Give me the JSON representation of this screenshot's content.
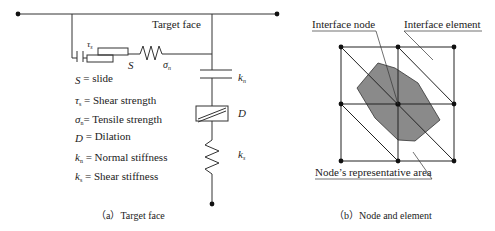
{
  "panel_a": {
    "label_target_face": "Target face",
    "symbols": {
      "tau": "τ",
      "tau_sub": "s",
      "S": "S",
      "sigma": "σ",
      "sigma_sub": "n",
      "kn": "k",
      "kn_sub": "n",
      "D": "D",
      "ks": "k",
      "ks_sub": "s"
    },
    "legend": [
      {
        "sym": "S",
        "sub": "",
        "text": " = slide"
      },
      {
        "sym": "τ",
        "sub": "s",
        "text": " = Shear strength"
      },
      {
        "sym": "σ",
        "sub": "n",
        "text": "= Tensile strength"
      },
      {
        "sym": "D",
        "sub": "",
        "text": " = Dilation"
      },
      {
        "sym": "k",
        "sub": "n",
        "text": " = Normal stiffness"
      },
      {
        "sym": "k",
        "sub": "s",
        "text": " = Shear stiffness"
      }
    ],
    "caption": "（a）Target face"
  },
  "panel_b": {
    "label_interface_node": "Interface node",
    "label_interface_element": "Interface element",
    "label_representative_area": "Node’s representative area",
    "caption": "（b）Node and element",
    "colors": {
      "area_fill": "#8a8a8a",
      "line": "#222222"
    }
  }
}
